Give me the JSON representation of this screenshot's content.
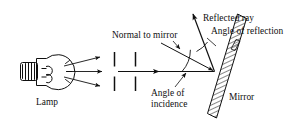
{
  "figure": {
    "type": "ray-diagram",
    "background_color": "#ffffff",
    "ink_color": "#101010"
  },
  "labels": {
    "normal_to_mirror": "Normal to mirror",
    "reflected_ray": "Reflected ray",
    "angle_of_reflection": "Angle of reflection",
    "angle_of_incidence": "Angle of\nincidence",
    "lamp": "Lamp",
    "mirror": "Mirror"
  },
  "components": {
    "lamp": {
      "name": "light-bulb",
      "label": "Lamp"
    },
    "barriers": [
      {
        "name": "first-slit-barrier"
      },
      {
        "name": "second-slit-barrier"
      }
    ],
    "incident_ray": {
      "name": "incident-ray"
    },
    "reflected_ray": {
      "name": "reflected-ray"
    },
    "normal_line": {
      "name": "normal-line"
    },
    "mirror_surface": {
      "name": "mirror-surface"
    },
    "angle_arcs": [
      {
        "name": "angle-of-incidence-arc"
      },
      {
        "name": "angle-of-reflection-arc"
      }
    ]
  }
}
